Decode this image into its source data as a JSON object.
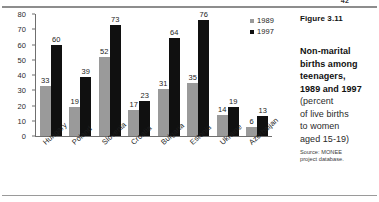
{
  "page": {
    "number": "42"
  },
  "figure": {
    "number_label": "Figure 3.11",
    "title_line1": "Non-marital",
    "title_line2": "births among",
    "title_line3": "teenagers,",
    "title_line4": "1989 and 1997",
    "sub_line1": "(percent",
    "sub_line2": "of live births",
    "sub_line3": "to women",
    "sub_line4": "aged 15-19)",
    "source_line1": "Source: MONEE",
    "source_line2": "project database."
  },
  "legend": {
    "position": "top-right",
    "items": [
      {
        "label": "1989",
        "color": "#9a9a9a"
      },
      {
        "label": "1997",
        "color": "#101010"
      }
    ]
  },
  "chart_data": {
    "type": "bar",
    "title": "Non-marital births among teenagers, 1989 and 1997",
    "subtitle": "(percent of live births to women aged 15-19)",
    "xlabel": "",
    "ylabel": "",
    "ylim": [
      0,
      80
    ],
    "yticks": [
      0,
      10,
      20,
      30,
      40,
      50,
      60,
      70,
      80
    ],
    "grid": false,
    "legend_position": "top-right",
    "source": "Source: MONEE project database.",
    "categories": [
      "Hungary",
      "Poland",
      "Slovenia",
      "Croatia",
      "Bulgaria",
      "Estonia",
      "Ukraine",
      "Azerbaijan"
    ],
    "series": [
      {
        "name": "1989",
        "color": "#9a9a9a",
        "values": [
          33,
          19,
          52,
          17,
          31,
          35,
          14,
          6
        ]
      },
      {
        "name": "1997",
        "color": "#101010",
        "values": [
          60,
          39,
          73,
          23,
          64,
          76,
          19,
          13
        ]
      }
    ]
  }
}
